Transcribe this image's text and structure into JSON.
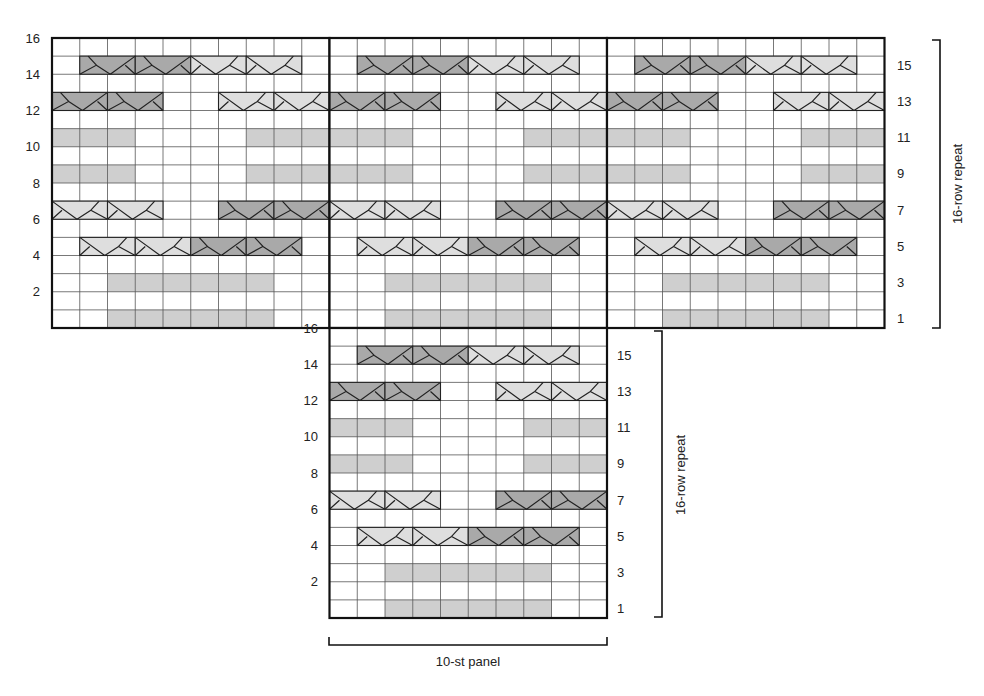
{
  "colors": {
    "grid": "#555555",
    "border": "#111111",
    "shade": "#cfcfcf",
    "cable_dark": "#a9a9a9",
    "cable_light": "#dedede",
    "line": "#222222"
  },
  "chart_data": {
    "type": "table",
    "stitches_per_panel": 10,
    "rows": 16,
    "top_panels": 3,
    "pattern_rows": [
      {
        "row": 1,
        "shaded": [
          2,
          3,
          4,
          5,
          6,
          7
        ],
        "cables": []
      },
      {
        "row": 3,
        "shaded": [
          2,
          3,
          4,
          5,
          6,
          7
        ],
        "cables": []
      },
      {
        "row": 5,
        "shaded": [],
        "cables": [
          {
            "start": 1,
            "tone": "light"
          },
          {
            "start": 3,
            "tone": "light"
          },
          {
            "start": 5,
            "tone": "dark"
          },
          {
            "start": 7,
            "tone": "dark"
          }
        ]
      },
      {
        "row": 7,
        "shaded": [],
        "cables": [
          {
            "start": 0,
            "tone": "light"
          },
          {
            "start": 2,
            "tone": "light"
          },
          {
            "start": 6,
            "tone": "dark"
          },
          {
            "start": 8,
            "tone": "dark"
          }
        ]
      },
      {
        "row": 9,
        "shaded": [
          0,
          1,
          2,
          7,
          8,
          9
        ],
        "cables": []
      },
      {
        "row": 11,
        "shaded": [
          0,
          1,
          2,
          7,
          8,
          9
        ],
        "cables": []
      },
      {
        "row": 13,
        "shaded": [],
        "cables": [
          {
            "start": 0,
            "tone": "dark"
          },
          {
            "start": 2,
            "tone": "dark"
          },
          {
            "start": 6,
            "tone": "light"
          },
          {
            "start": 8,
            "tone": "light"
          }
        ]
      },
      {
        "row": 15,
        "shaded": [],
        "cables": [
          {
            "start": 1,
            "tone": "dark"
          },
          {
            "start": 3,
            "tone": "dark"
          },
          {
            "start": 5,
            "tone": "light"
          },
          {
            "start": 7,
            "tone": "light"
          }
        ]
      }
    ]
  },
  "top_chart": {
    "left_row_labels": [
      "16",
      "14",
      "12",
      "10",
      "8",
      "6",
      "4",
      "2"
    ],
    "right_row_labels": [
      "15",
      "13",
      "11",
      "9",
      "7",
      "5",
      "3",
      "1"
    ],
    "bracket_label": "16-row repeat"
  },
  "bottom_chart": {
    "left_row_labels": [
      "16",
      "14",
      "12",
      "10",
      "8",
      "6",
      "4",
      "2"
    ],
    "right_row_labels": [
      "15",
      "13",
      "11",
      "9",
      "7",
      "5",
      "3",
      "1"
    ],
    "bracket_label": "16-row repeat",
    "width_label": "10-st panel"
  }
}
